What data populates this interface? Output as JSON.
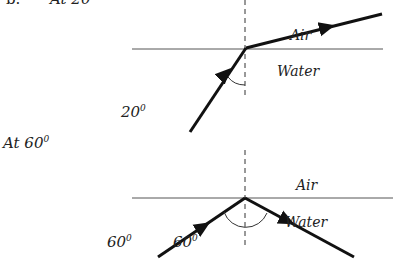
{
  "part_label": "b.",
  "diagram_1": {
    "heading": "At 20",
    "heading_sup": "0",
    "medium_top": "Air",
    "medium_bottom": "Water",
    "angle_label": "20",
    "angle_sup": "0"
  },
  "diagram_2": {
    "heading": "At 60",
    "heading_sup": "0",
    "medium_top": "Air",
    "medium_bottom": "Water",
    "angle_label_left": "60",
    "angle_label_left_sup": "0",
    "angle_label_inner": "60",
    "angle_label_inner_sup": "0"
  },
  "colors": {
    "ray": "#111111",
    "interface": "#555555",
    "normal": "#333333",
    "text": "#222222"
  }
}
